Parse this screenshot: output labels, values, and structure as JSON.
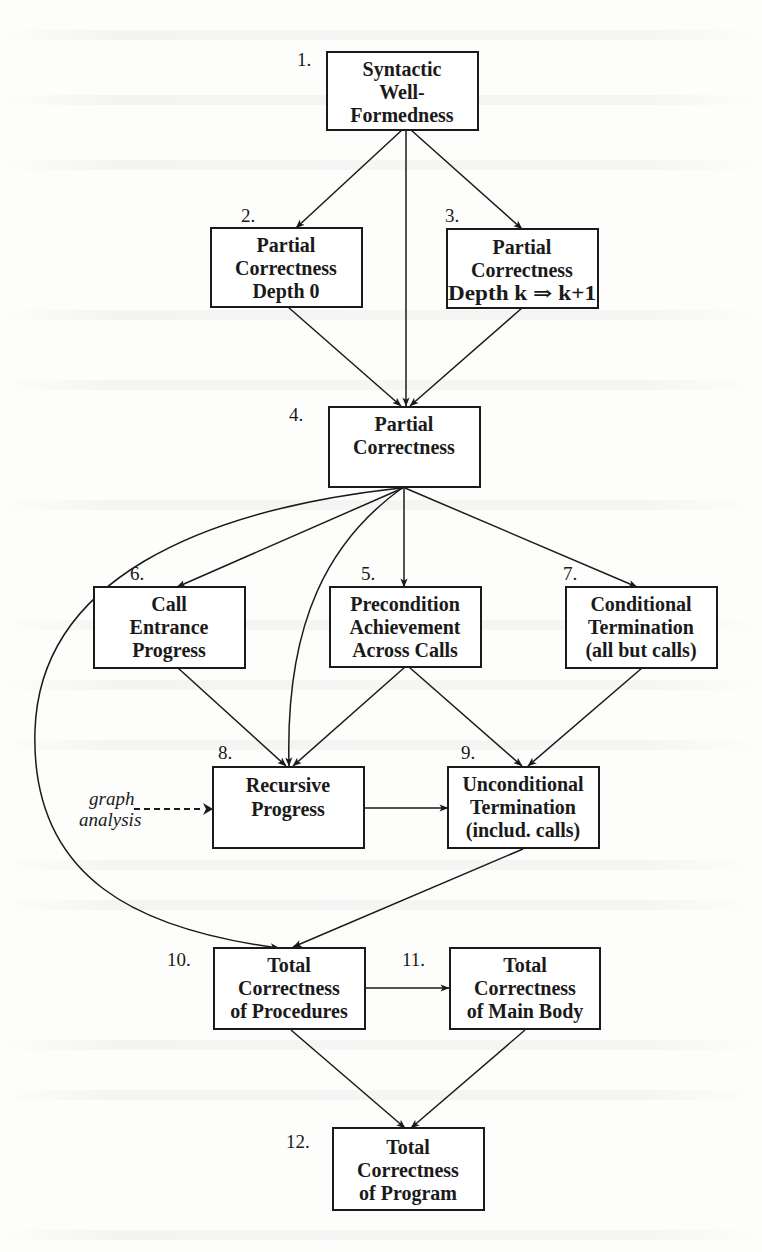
{
  "diagram": {
    "type": "dependency-flowchart",
    "nodes": [
      {
        "id": "1",
        "number": "1.",
        "lines": [
          "Syntactic",
          "Well-",
          "Formedness"
        ]
      },
      {
        "id": "2",
        "number": "2.",
        "lines": [
          "Partial",
          "Correctness",
          "Depth 0"
        ]
      },
      {
        "id": "3",
        "number": "3.",
        "lines": [
          "Partial",
          "Correctness",
          "Depth k ⇒ k+1"
        ]
      },
      {
        "id": "4",
        "number": "4.",
        "lines": [
          "Partial",
          "Correctness"
        ]
      },
      {
        "id": "5",
        "number": "5.",
        "lines": [
          "Precondition",
          "Achievement",
          "Across Calls"
        ]
      },
      {
        "id": "6",
        "number": "6.",
        "lines": [
          "Call",
          "Entrance",
          "Progress"
        ]
      },
      {
        "id": "7",
        "number": "7.",
        "lines": [
          "Conditional",
          "Termination",
          "(all but calls)"
        ]
      },
      {
        "id": "8",
        "number": "8.",
        "lines": [
          "Recursive",
          "Progress"
        ]
      },
      {
        "id": "9",
        "number": "9.",
        "lines": [
          "Unconditional",
          "Termination",
          "(includ. calls)"
        ]
      },
      {
        "id": "10",
        "number": "10.",
        "lines": [
          "Total",
          "Correctness",
          "of Procedures"
        ]
      },
      {
        "id": "11",
        "number": "11.",
        "lines": [
          "Total",
          "Correctness",
          "of Main Body"
        ]
      },
      {
        "id": "12",
        "number": "12.",
        "lines": [
          "Total",
          "Correctness",
          "of Program"
        ]
      }
    ],
    "edges": [
      {
        "from": "1",
        "to": "2"
      },
      {
        "from": "1",
        "to": "3"
      },
      {
        "from": "1",
        "to": "4"
      },
      {
        "from": "2",
        "to": "4"
      },
      {
        "from": "3",
        "to": "4"
      },
      {
        "from": "4",
        "to": "5"
      },
      {
        "from": "4",
        "to": "6"
      },
      {
        "from": "4",
        "to": "7"
      },
      {
        "from": "4",
        "to": "8",
        "curved": true
      },
      {
        "from": "4",
        "to": "10",
        "curved": true
      },
      {
        "from": "5",
        "to": "8"
      },
      {
        "from": "5",
        "to": "9"
      },
      {
        "from": "6",
        "to": "8"
      },
      {
        "from": "7",
        "to": "9"
      },
      {
        "from": "8",
        "to": "9"
      },
      {
        "from": "9",
        "to": "10"
      },
      {
        "from": "10",
        "to": "11"
      },
      {
        "from": "10",
        "to": "12"
      },
      {
        "from": "11",
        "to": "12"
      }
    ],
    "external_input": {
      "label_lines": [
        "graph",
        "analysis"
      ],
      "to": "8",
      "style": "dashed"
    }
  }
}
